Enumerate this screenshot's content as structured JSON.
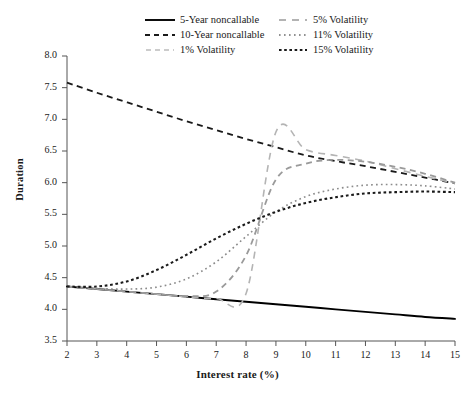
{
  "chart_data": {
    "type": "line",
    "title": "",
    "xlabel": "Interest rate (%)",
    "ylabel": "Duration",
    "xlim": [
      2,
      15
    ],
    "ylim": [
      3.5,
      8.0
    ],
    "xticks": [
      "2",
      "3",
      "4",
      "5",
      "6",
      "7",
      "8",
      "9",
      "10",
      "11",
      "12",
      "13",
      "14",
      "15"
    ],
    "yticks": [
      "8.0",
      "7.5",
      "7.0",
      "6.5",
      "6.0",
      "5.5",
      "5.0",
      "4.5",
      "4.0",
      "3.5"
    ],
    "grid": false,
    "legend_position": "top-center",
    "x": [
      2,
      3,
      4,
      5,
      6,
      7,
      8,
      9,
      10,
      11,
      12,
      13,
      14,
      15
    ],
    "series": [
      {
        "name": "5-Year noncallable",
        "color": "#000000",
        "style": "solid",
        "values": [
          4.36,
          4.32,
          4.28,
          4.24,
          4.2,
          4.16,
          4.12,
          4.08,
          4.04,
          4.0,
          3.96,
          3.92,
          3.88,
          3.85
        ]
      },
      {
        "name": "10-Year noncallable",
        "color": "#1a1a1a",
        "style": "dashed",
        "values": [
          7.58,
          7.42,
          7.27,
          7.12,
          6.97,
          6.83,
          6.69,
          6.56,
          6.43,
          6.34,
          6.26,
          6.17,
          6.08,
          5.99
        ]
      },
      {
        "name": "1% Volatility",
        "color": "#b4b4b4",
        "style": "long-dash",
        "values": [
          4.36,
          4.32,
          4.28,
          4.24,
          4.2,
          4.17,
          4.25,
          6.8,
          6.52,
          6.43,
          6.34,
          6.22,
          6.1,
          5.99
        ]
      },
      {
        "name": "5% Volatility",
        "color": "#9a9a9a",
        "style": "dashed",
        "values": [
          4.36,
          4.32,
          4.28,
          4.24,
          4.21,
          4.28,
          4.85,
          6.05,
          6.3,
          6.36,
          6.33,
          6.25,
          6.14,
          6.0
        ]
      },
      {
        "name": "11% Volatility",
        "color": "#8c8c8c",
        "style": "dotted",
        "values": [
          4.36,
          4.33,
          4.32,
          4.35,
          4.48,
          4.75,
          5.15,
          5.54,
          5.78,
          5.9,
          5.96,
          5.97,
          5.95,
          5.9
        ]
      },
      {
        "name": "15% Volatility",
        "color": "#1a1a1a",
        "style": "dotted-bold",
        "values": [
          4.36,
          4.36,
          4.44,
          4.62,
          4.86,
          5.12,
          5.35,
          5.54,
          5.68,
          5.77,
          5.83,
          5.85,
          5.86,
          5.85
        ]
      }
    ]
  },
  "legend": {
    "entries": [
      {
        "label": "5-Year noncallable"
      },
      {
        "label": "5% Volatility"
      },
      {
        "label": "10-Year noncallable"
      },
      {
        "label": "11% Volatility"
      },
      {
        "label": "1% Volatility"
      },
      {
        "label": "15% Volatility"
      }
    ]
  },
  "axes": {
    "y_title": "Duration",
    "x_title": "Interest rate (%)"
  }
}
